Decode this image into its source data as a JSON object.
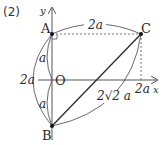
{
  "problem_label": "(2)",
  "axes": {
    "x_label": "x",
    "y_label": "y",
    "origin_label": "O"
  },
  "points": {
    "A": {
      "label": "A",
      "x": 52,
      "y": 34
    },
    "B": {
      "label": "B",
      "x": 52,
      "y": 126
    },
    "C": {
      "label": "C",
      "x": 141,
      "y": 34
    },
    "O": {
      "label": "O",
      "x": 52,
      "y": 80
    }
  },
  "dimensions": {
    "AC": "2a",
    "AB": "2a",
    "AO": "a",
    "OB": "a",
    "BC": "2√2 a",
    "x_of_C": "2a"
  },
  "colors": {
    "stroke": "#2a2a2a",
    "axis": "#555555",
    "dashed": "#777777"
  }
}
